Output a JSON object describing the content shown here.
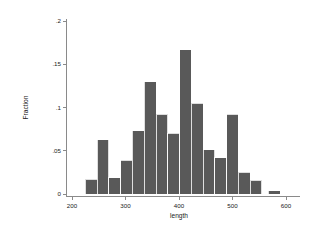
{
  "chart_data": {
    "type": "bar",
    "title": "",
    "subtitle": "",
    "xlabel": "length",
    "ylabel": "Fraction",
    "xlim": [
      200,
      600
    ],
    "ylim": [
      0,
      0.2
    ],
    "grid": false,
    "legend": null,
    "bar_color": "#595959",
    "axis_color": "#8a8a8a",
    "background": "#ffffff",
    "bin_width": 22,
    "x_ticks": [
      200,
      300,
      400,
      500,
      600
    ],
    "x_tick_labels": [
      "200",
      "300",
      "400",
      "500",
      "600"
    ],
    "y_ticks": [
      0,
      0.05,
      0.1,
      0.15,
      0.2
    ],
    "y_tick_labels": [
      "0",
      ".05",
      ".1",
      ".15",
      ".2"
    ],
    "bin_edges": [
      225,
      247,
      269,
      291,
      313,
      335,
      357,
      379,
      401,
      423,
      445,
      467,
      489,
      511,
      533,
      555,
      567,
      589
    ],
    "bins": [
      {
        "left": 225,
        "right": 247,
        "center": 236,
        "value": 0.017
      },
      {
        "left": 247,
        "right": 269,
        "center": 258,
        "value": 0.063
      },
      {
        "left": 269,
        "right": 291,
        "center": 280,
        "value": 0.019
      },
      {
        "left": 291,
        "right": 313,
        "center": 302,
        "value": 0.039
      },
      {
        "left": 313,
        "right": 335,
        "center": 324,
        "value": 0.073
      },
      {
        "left": 335,
        "right": 357,
        "center": 346,
        "value": 0.13
      },
      {
        "left": 357,
        "right": 379,
        "center": 368,
        "value": 0.092
      },
      {
        "left": 379,
        "right": 401,
        "center": 390,
        "value": 0.07
      },
      {
        "left": 401,
        "right": 423,
        "center": 412,
        "value": 0.167
      },
      {
        "left": 423,
        "right": 445,
        "center": 434,
        "value": 0.105
      },
      {
        "left": 445,
        "right": 467,
        "center": 456,
        "value": 0.051
      },
      {
        "left": 467,
        "right": 489,
        "center": 478,
        "value": 0.042
      },
      {
        "left": 489,
        "right": 511,
        "center": 500,
        "value": 0.092
      },
      {
        "left": 511,
        "right": 533,
        "center": 522,
        "value": 0.025
      },
      {
        "left": 533,
        "right": 555,
        "center": 544,
        "value": 0.016
      },
      {
        "left": 567,
        "right": 589,
        "center": 578,
        "value": 0.004
      }
    ],
    "categories": [
      "236",
      "258",
      "280",
      "302",
      "324",
      "346",
      "368",
      "390",
      "412",
      "434",
      "456",
      "478",
      "500",
      "522",
      "544",
      "578"
    ],
    "values": [
      0.017,
      0.063,
      0.019,
      0.039,
      0.073,
      0.13,
      0.092,
      0.07,
      0.167,
      0.105,
      0.051,
      0.042,
      0.092,
      0.025,
      0.016,
      0.004
    ]
  }
}
